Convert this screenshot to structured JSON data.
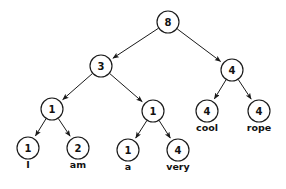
{
  "diagram": {
    "background_color": "#ffffff",
    "stroke_color": "#1a1a1a",
    "text_color": "#111111",
    "node_radius": 11,
    "nodes": [
      {
        "id": "root",
        "value": "8",
        "word": "",
        "x": 168,
        "y": 22
      },
      {
        "id": "n3",
        "value": "3",
        "word": "",
        "x": 101,
        "y": 66
      },
      {
        "id": "n4r",
        "value": "4",
        "word": "",
        "x": 232,
        "y": 70
      },
      {
        "id": "n1a",
        "value": "1",
        "word": "",
        "x": 52,
        "y": 109
      },
      {
        "id": "n1b",
        "value": "1",
        "word": "",
        "x": 153,
        "y": 111
      },
      {
        "id": "cool",
        "value": "4",
        "word": "cool",
        "x": 207,
        "y": 111
      },
      {
        "id": "rope",
        "value": "4",
        "word": "rope",
        "x": 259,
        "y": 111
      },
      {
        "id": "I",
        "value": "1",
        "word": "I",
        "x": 28,
        "y": 148
      },
      {
        "id": "am",
        "value": "2",
        "word": "am",
        "x": 78,
        "y": 148
      },
      {
        "id": "a",
        "value": "1",
        "word": "a",
        "x": 128,
        "y": 150
      },
      {
        "id": "very",
        "value": "4",
        "word": "very",
        "x": 178,
        "y": 150
      }
    ],
    "edges": [
      {
        "from": "root",
        "to": "n3"
      },
      {
        "from": "root",
        "to": "n4r"
      },
      {
        "from": "n3",
        "to": "n1a"
      },
      {
        "from": "n3",
        "to": "n1b"
      },
      {
        "from": "n4r",
        "to": "cool"
      },
      {
        "from": "n4r",
        "to": "rope"
      },
      {
        "from": "n1a",
        "to": "I"
      },
      {
        "from": "n1a",
        "to": "am"
      },
      {
        "from": "n1b",
        "to": "a"
      },
      {
        "from": "n1b",
        "to": "very"
      }
    ]
  }
}
